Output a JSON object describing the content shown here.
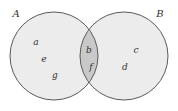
{
  "diagram": {
    "type": "venn",
    "colors": {
      "background": "#ffffff",
      "circle_fill": "#ececec",
      "intersection_fill": "#c9c9c9",
      "stroke": "#5a5a5a",
      "text": "#333333"
    },
    "sets": [
      {
        "id": "A",
        "label": "A",
        "elements_only": [
          "a",
          "e",
          "g"
        ]
      },
      {
        "id": "B",
        "label": "B",
        "elements_only": [
          "c",
          "d"
        ]
      }
    ],
    "intersection": {
      "label": "A ∩ B",
      "elements": [
        "b",
        "f"
      ]
    },
    "labels": {
      "set_a": "A",
      "set_b": "B",
      "a": "a",
      "e": "e",
      "g": "g",
      "b": "b",
      "f": "f",
      "c": "c",
      "d": "d"
    }
  }
}
